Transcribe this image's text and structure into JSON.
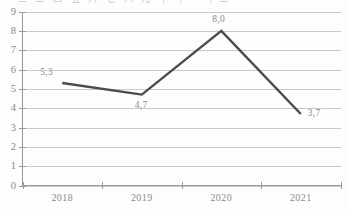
{
  "scan": {
    "top_fragment": "一 二 三 四 五 六 七 八 九 十 十一 十二"
  },
  "chart_data": {
    "type": "line",
    "title": "",
    "subtitle": "",
    "xlabel": "",
    "ylabel": "",
    "categories": [
      "2018",
      "2019",
      "2020",
      "2021"
    ],
    "values": [
      5.3,
      4.7,
      8.0,
      3.7
    ],
    "value_labels": [
      "5,3",
      "4,7",
      "8,0",
      "3,7"
    ],
    "decimal_separator": ",",
    "series": [
      {
        "name": "",
        "values": [
          5.3,
          4.7,
          8.0,
          3.7
        ]
      }
    ],
    "ylim": [
      0,
      9
    ],
    "y_ticks": [
      0,
      1,
      2,
      3,
      4,
      5,
      6,
      7,
      8,
      9
    ],
    "y_tick_labels": [
      "0",
      "1",
      "2",
      "3",
      "4",
      "5",
      "6",
      "7",
      "8",
      "9"
    ],
    "x_tick_labels": [
      "2018",
      "2019",
      "2020",
      "2021"
    ],
    "grid": "horizontal",
    "legend": "none",
    "colors": {
      "line": "#4a4a4f",
      "grid": "#c9c9cd",
      "axis": "#9a9a9f",
      "label_text": "#8b8b90",
      "background": "#fdfdfd"
    },
    "annotations": [
      {
        "text": "5,0",
        "position": "above-left"
      },
      {
        "text": "4,7",
        "position": "below"
      },
      {
        "text": "8,0",
        "position": "above"
      },
      {
        "text": "3,7",
        "position": "right"
      }
    ]
  }
}
